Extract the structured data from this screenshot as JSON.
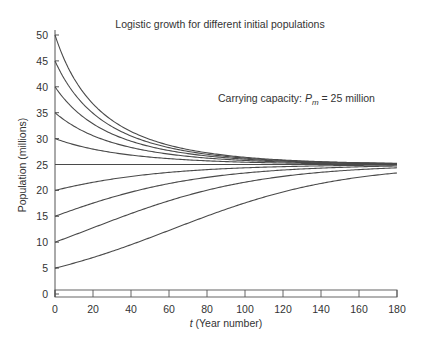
{
  "chart_data": {
    "type": "line",
    "title": "Logistic growth for different initial populations",
    "annotation": {
      "prefix": "Carrying capacity: ",
      "symbol": "P",
      "subscript": "m",
      "suffix": " = 25 million"
    },
    "xlabel_italic": "t",
    "xlabel_rest": " (Year number)",
    "ylabel": "Population (millions)",
    "xlim": [
      0,
      180
    ],
    "ylim": [
      0,
      50
    ],
    "xticks": [
      0,
      20,
      40,
      60,
      80,
      100,
      120,
      140,
      160,
      180
    ],
    "yticks": [
      0,
      5,
      10,
      15,
      20,
      25,
      30,
      35,
      40,
      45,
      50
    ],
    "carrying_capacity": 25,
    "growth_rate": 0.0225,
    "initial_populations": [
      5,
      10,
      15,
      20,
      25,
      30,
      35,
      40,
      45,
      50
    ],
    "series": [
      {
        "name": "P0=5",
        "x": [
          0,
          20,
          40,
          60,
          80,
          100,
          120,
          140,
          160,
          180
        ],
        "values": [
          5.0,
          7.0,
          9.5,
          12.2,
          15.0,
          17.6,
          19.9,
          21.6,
          22.9,
          23.7
        ]
      },
      {
        "name": "P0=10",
        "x": [
          0,
          20,
          40,
          60,
          80,
          100,
          120,
          140,
          160,
          180
        ],
        "values": [
          10.0,
          12.9,
          15.8,
          18.4,
          20.4,
          21.9,
          23.0,
          23.7,
          24.2,
          24.5
        ]
      },
      {
        "name": "P0=15",
        "x": [
          0,
          20,
          40,
          60,
          80,
          100,
          120,
          140,
          160,
          180
        ],
        "values": [
          15.0,
          17.8,
          20.0,
          21.7,
          22.9,
          23.7,
          24.2,
          24.5,
          24.7,
          24.8
        ]
      },
      {
        "name": "P0=20",
        "x": [
          0,
          20,
          40,
          60,
          80,
          100,
          120,
          140,
          160,
          180
        ],
        "values": [
          20.0,
          21.8,
          23.0,
          23.8,
          24.3,
          24.6,
          24.7,
          24.8,
          24.9,
          24.9
        ]
      },
      {
        "name": "P0=25",
        "x": [
          0,
          20,
          40,
          60,
          80,
          100,
          120,
          140,
          160,
          180
        ],
        "values": [
          25,
          25,
          25,
          25,
          25,
          25,
          25,
          25,
          25,
          25
        ]
      },
      {
        "name": "P0=30",
        "x": [
          0,
          20,
          40,
          60,
          80,
          100,
          120,
          140,
          160,
          180
        ],
        "values": [
          30.0,
          27.9,
          26.6,
          25.9,
          25.5,
          25.3,
          25.2,
          25.1,
          25.0,
          25.0
        ]
      },
      {
        "name": "P0=35",
        "x": [
          0,
          20,
          40,
          60,
          80,
          100,
          120,
          140,
          160,
          180
        ],
        "values": [
          35.0,
          30.5,
          28.0,
          26.6,
          25.9,
          25.5,
          25.3,
          25.1,
          25.1,
          25.0
        ]
      },
      {
        "name": "P0=40",
        "x": [
          0,
          20,
          40,
          60,
          80,
          100,
          120,
          140,
          160,
          180
        ],
        "values": [
          40.0,
          32.5,
          28.9,
          27.0,
          26.1,
          25.6,
          25.3,
          25.2,
          25.1,
          25.0
        ]
      },
      {
        "name": "P0=45",
        "x": [
          0,
          20,
          40,
          60,
          80,
          100,
          120,
          140,
          160,
          180
        ],
        "values": [
          45.0,
          34.1,
          29.6,
          27.3,
          26.2,
          25.6,
          25.3,
          25.2,
          25.1,
          25.0
        ]
      },
      {
        "name": "P0=50",
        "x": [
          0,
          20,
          40,
          60,
          80,
          100,
          120,
          140,
          160,
          180
        ],
        "values": [
          50.0,
          35.4,
          30.1,
          27.5,
          26.3,
          25.7,
          25.4,
          25.2,
          25.1,
          25.0
        ]
      }
    ],
    "grid": false,
    "legend": "none"
  },
  "style": {
    "line_color": "#4a4a4a",
    "axis_color": "#555555",
    "text_color": "#333333"
  }
}
